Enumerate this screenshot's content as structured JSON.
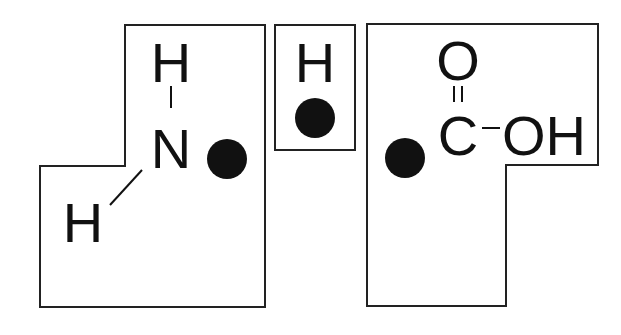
{
  "diagram": {
    "colors": {
      "outline": "#222222",
      "text": "#111111",
      "dot": "#111111",
      "background": "#ffffff"
    },
    "pieces": [
      {
        "id": "amino-group",
        "atoms": {
          "top_h": "H",
          "center": "N",
          "lower_h": "H"
        },
        "bonds": [
          "N-H (vertical)",
          "N-H (diagonal)"
        ],
        "attachment_dot": true
      },
      {
        "id": "hydrogen",
        "atoms": {
          "center": "H"
        },
        "attachment_dot": true
      },
      {
        "id": "carboxyl-group",
        "atoms": {
          "top_o": "O",
          "carbon": "C",
          "hydroxyl": "OH"
        },
        "bonds": [
          "C=O (double)",
          "C-OH (single)"
        ],
        "attachment_dot": true
      }
    ]
  }
}
